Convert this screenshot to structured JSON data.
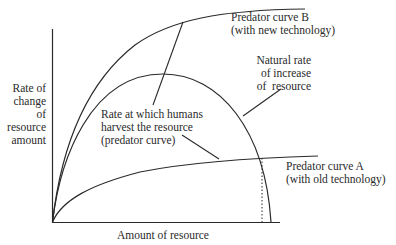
{
  "diagram": {
    "type": "economics-resource-harvest",
    "axes": {
      "y_label_lines": [
        "Rate of",
        "change",
        "of",
        "resource",
        "amount"
      ],
      "x_label": "Amount of resource"
    },
    "labels": {
      "predator_b": [
        "Predator curve B",
        "(with new technology)"
      ],
      "natural_rate": [
        "Natural rate",
        "of increase",
        "of  resource"
      ],
      "harvest_rate": [
        "Rate at which humans",
        "harvest the resource",
        "(predator curve)"
      ],
      "predator_a": [
        "Predator curve A",
        "(with old technology)"
      ]
    },
    "colors": {
      "line": "#2a2a2a",
      "background": "#ffffff"
    }
  }
}
